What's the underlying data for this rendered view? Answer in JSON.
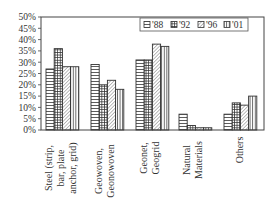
{
  "chart_data": {
    "type": "bar",
    "title": "",
    "xlabel": "",
    "ylabel": "",
    "ylim": [
      0,
      50
    ],
    "yticks": [
      "0%",
      "5%",
      "10%",
      "15%",
      "20%",
      "25%",
      "30%",
      "35%",
      "40%",
      "45%",
      "50%"
    ],
    "grid": false,
    "legend_position": "top-right-inside",
    "categories": [
      [
        "Steel (strip,",
        "bar, plate",
        "anchor, grid)"
      ],
      [
        "Geowoven,",
        "Geonowoven"
      ],
      [
        "Geonet,",
        "Geogrid"
      ],
      [
        "Natural",
        "Materials"
      ],
      [
        "Others"
      ]
    ],
    "series": [
      {
        "name": "'88",
        "pattern": "horizontal",
        "values": [
          27,
          29,
          31,
          7,
          7
        ]
      },
      {
        "name": "'92",
        "pattern": "grid",
        "values": [
          36,
          20,
          31,
          2,
          12
        ]
      },
      {
        "name": "'96",
        "pattern": "diagonal",
        "values": [
          28,
          22,
          38,
          1,
          11
        ]
      },
      {
        "name": "'01",
        "pattern": "vertical",
        "values": [
          28,
          18,
          37,
          1,
          15
        ]
      }
    ]
  },
  "colors": {
    "axis": "#444444",
    "bar_outline": "#333333",
    "background": "#ffffff"
  }
}
